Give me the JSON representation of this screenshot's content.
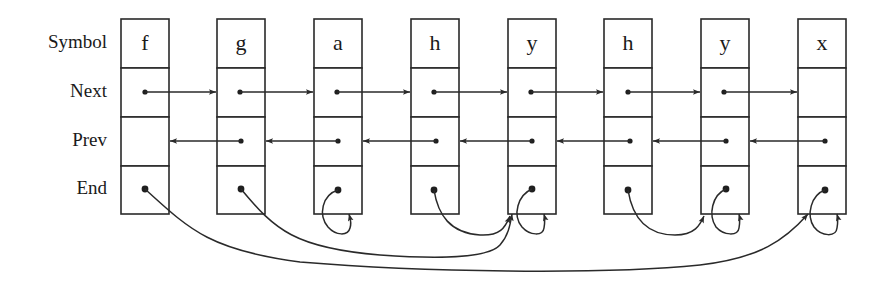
{
  "diagram": {
    "row_labels": [
      "Symbol",
      "Next",
      "Prev",
      "End"
    ],
    "nodes": [
      {
        "index": 0,
        "symbol": "f",
        "next": 1,
        "prev": null,
        "end": 7
      },
      {
        "index": 1,
        "symbol": "g",
        "next": 2,
        "prev": 0,
        "end": 4
      },
      {
        "index": 2,
        "symbol": "a",
        "next": 3,
        "prev": 1,
        "end": 2
      },
      {
        "index": 3,
        "symbol": "h",
        "next": 4,
        "prev": 2,
        "end": 4
      },
      {
        "index": 4,
        "symbol": "y",
        "next": 5,
        "prev": 3,
        "end": 4
      },
      {
        "index": 5,
        "symbol": "h",
        "next": 6,
        "prev": 4,
        "end": 6
      },
      {
        "index": 6,
        "symbol": "y",
        "next": 7,
        "prev": 5,
        "end": 6
      },
      {
        "index": 7,
        "symbol": "x",
        "next": null,
        "prev": 6,
        "end": 7
      }
    ],
    "colors": {
      "stroke": "#2a2a2a",
      "background": "#ffffff",
      "text": "#1a1a1a"
    }
  }
}
